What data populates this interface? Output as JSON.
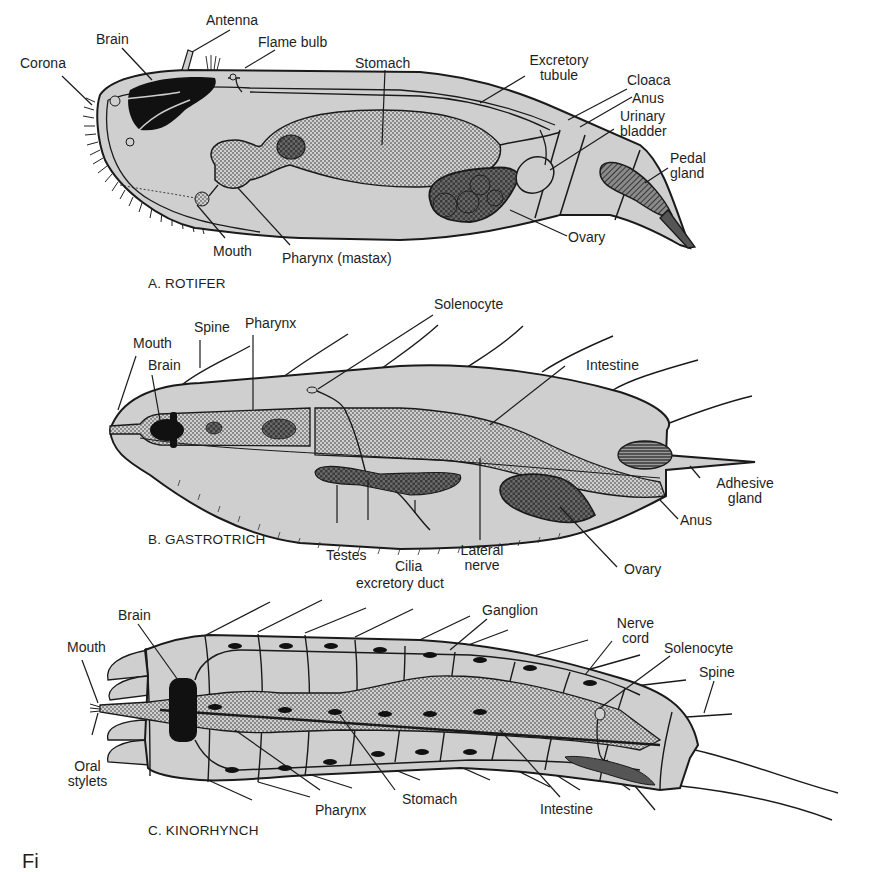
{
  "figure": {
    "caption_fragment": "Fi",
    "colors": {
      "body_fill": "#cfcfcf",
      "organ_stipple": "#bdbdbd",
      "dark_organ": "#111111",
      "outline": "#1a1a1a",
      "background": "#ffffff"
    }
  },
  "panels": [
    {
      "id": "A",
      "caption": "A. ROTIFER",
      "labels": [
        {
          "text": "Corona"
        },
        {
          "text": "Brain"
        },
        {
          "text": "Antenna"
        },
        {
          "text": "Flame bulb"
        },
        {
          "text": "Stomach"
        },
        {
          "text": "Excretory tubule"
        },
        {
          "text": "Cloaca"
        },
        {
          "text": "Anus"
        },
        {
          "text": "Urinary bladder"
        },
        {
          "text": "Pedal gland"
        },
        {
          "text": "Ovary"
        },
        {
          "text": "Mouth"
        },
        {
          "text": "Pharynx (mastax)"
        }
      ]
    },
    {
      "id": "B",
      "caption": "B. GASTROTRICH",
      "labels": [
        {
          "text": "Mouth"
        },
        {
          "text": "Brain"
        },
        {
          "text": "Spine"
        },
        {
          "text": "Pharynx"
        },
        {
          "text": "Solenocyte"
        },
        {
          "text": "Intestine"
        },
        {
          "text": "Adhesive gland"
        },
        {
          "text": "Anus"
        },
        {
          "text": "Ovary"
        },
        {
          "text": "Testes"
        },
        {
          "text": "Cilia"
        },
        {
          "text": "excretory duct"
        },
        {
          "text": "Lateral nerve"
        }
      ]
    },
    {
      "id": "C",
      "caption": "C. KINORHYNCH",
      "labels": [
        {
          "text": "Brain"
        },
        {
          "text": "Mouth"
        },
        {
          "text": "Oral stylets"
        },
        {
          "text": "Ganglion"
        },
        {
          "text": "Nerve cord"
        },
        {
          "text": "Solenocyte"
        },
        {
          "text": "Spine"
        },
        {
          "text": "Pharynx"
        },
        {
          "text": "Stomach"
        },
        {
          "text": "Intestine"
        }
      ]
    }
  ]
}
